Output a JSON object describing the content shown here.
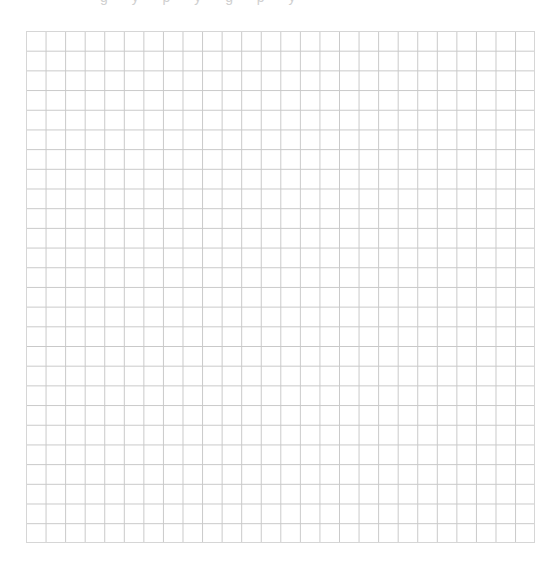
{
  "page": {
    "type": "graph-paper",
    "top_clipped_text": "g y p y g p y"
  },
  "grid": {
    "columns": 26,
    "rows": 26,
    "left": 26,
    "top": 31,
    "width": 509,
    "height": 512,
    "line_color": "#c9c9c9",
    "border_color": "#d6d6d6",
    "background": "#ffffff"
  }
}
